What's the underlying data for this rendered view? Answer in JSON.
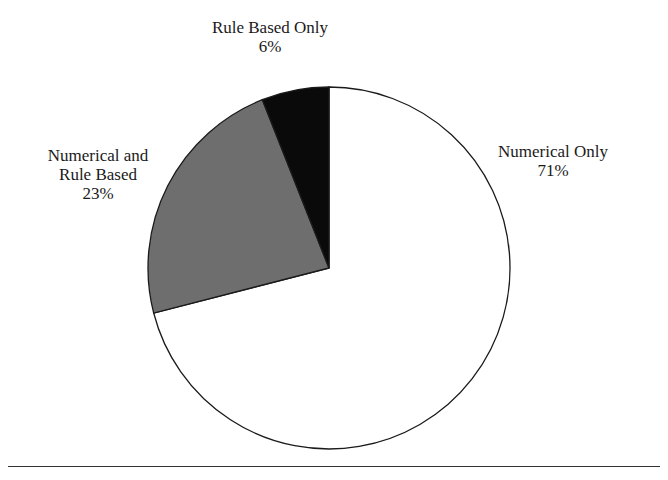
{
  "chart_data": {
    "type": "pie",
    "title": "",
    "start_angle_deg": 0,
    "direction": "clockwise",
    "slices": [
      {
        "label": "Numerical Only",
        "value": 71,
        "display": "71%",
        "color": "#ffffff"
      },
      {
        "label": "Numerical and Rule Based",
        "value": 23,
        "display": "23%",
        "color": "#6e6e6e"
      },
      {
        "label": "Rule Based Only",
        "value": 6,
        "display": "6%",
        "color": "#0a0a0a"
      }
    ],
    "legend": "none",
    "labels_outside": true
  },
  "labels": {
    "numerical_only": {
      "line1": "Numerical Only",
      "pct": "71%"
    },
    "numerical_and_rule": {
      "line1": "Numerical and",
      "line2": "Rule Based",
      "pct": "23%"
    },
    "rule_only": {
      "line1": "Rule Based Only",
      "pct": "6%"
    }
  }
}
